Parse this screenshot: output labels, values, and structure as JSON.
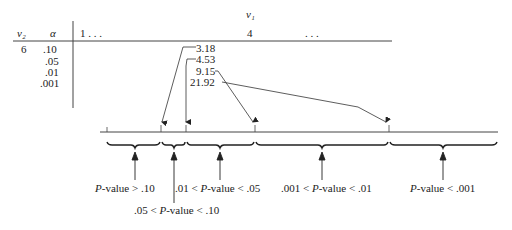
{
  "table": {
    "v1_header": "v₁",
    "v2_header": "v₂",
    "alpha_header": "α",
    "col_first": "1 . . .",
    "col_selected": "4",
    "col_rest": ". . .",
    "v2_value": "6",
    "alphas": [
      ".10",
      ".05",
      ".01",
      ".001"
    ],
    "critical_values": [
      "3.18",
      "4.53",
      "9.15",
      "21.92"
    ]
  },
  "intervals": [
    {
      "label_pre": "",
      "label_p": "P",
      "label_post": "-value > .10"
    },
    {
      "label_pre": ".05 < ",
      "label_p": "P",
      "label_post": "-value < .10"
    },
    {
      "label_pre": ".01 < ",
      "label_p": "P",
      "label_post": "-value < .05"
    },
    {
      "label_pre": ".001 < ",
      "label_p": "P",
      "label_post": "-value < .01"
    },
    {
      "label_pre": "",
      "label_p": "P",
      "label_post": "-value < .001"
    }
  ]
}
